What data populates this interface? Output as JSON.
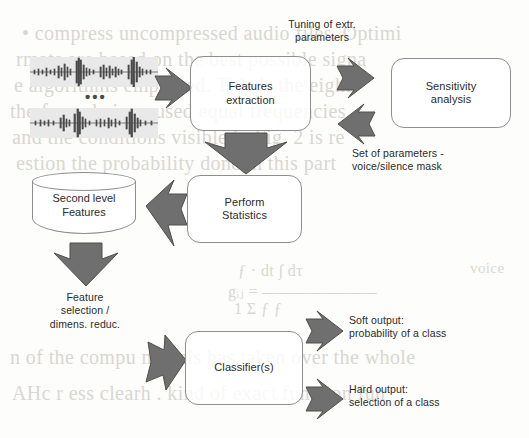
{
  "diagram": {
    "colors": {
      "arrow_fill": "#6f6f6f",
      "arrow_stroke": "#4f4f4f",
      "node_stroke": "#8e8e8e",
      "text": "#2b2b2b",
      "waveform": "#4a4a4a",
      "background": "#fdfdfb",
      "bleed_text": "#d9d7d2"
    },
    "nodes": [
      {
        "id": "features-extraction",
        "label_line1": "Features",
        "label_line2": "extraction"
      },
      {
        "id": "sensitivity-analysis",
        "label_line1": "Sensitivity",
        "label_line2": "analysis"
      },
      {
        "id": "perform-statistics",
        "label_line1": "Perform",
        "label_line2": "Statistics"
      },
      {
        "id": "classifier",
        "label_line1": "Classifier(s)",
        "label_line2": ""
      }
    ],
    "datastore": {
      "id": "second-level-features",
      "label_line1": "Second level",
      "label_line2": "Features"
    },
    "labels": {
      "tuning": "Tuning of extr.\nparameters",
      "set_of_parameters": "Set of parameters -\nvoice/silence mask",
      "feature_selection": "Feature\nselection /\ndimens. reduc.",
      "soft_output": "Soft output:\nprobability of a class",
      "hard_output": "Hard output:\nselection of a class"
    },
    "inputs": {
      "ellipsis": "•••",
      "waveform_count": 2,
      "waveform_name": "audio-waveform"
    },
    "arrows": [
      {
        "id": "waveforms-to-features",
        "direction": "right"
      },
      {
        "id": "features-to-sensitivity",
        "direction": "right"
      },
      {
        "id": "sensitivity-to-features",
        "direction": "left"
      },
      {
        "id": "features-to-statistics",
        "direction": "down"
      },
      {
        "id": "statistics-to-datastore",
        "direction": "left"
      },
      {
        "id": "datastore-to-selection",
        "direction": "down"
      },
      {
        "id": "selection-to-classifier",
        "direction": "right"
      },
      {
        "id": "classifier-to-soft-output",
        "direction": "right"
      },
      {
        "id": "classifier-to-hard-output",
        "direction": "right"
      }
    ]
  },
  "background_bleed": {
    "lines": [
      {
        "text": "• compress uncompressed audio files. Optimi",
        "x": 22,
        "y": 22,
        "size": 20
      },
      {
        "text": "rmats are based on the best possible signa",
        "x": 16,
        "y": 48,
        "size": 20
      },
      {
        "text": "e algorithms employed. This is the eight",
        "x": 14,
        "y": 74,
        "size": 20
      },
      {
        "text": "the formula is as used equal frequencies",
        "x": 10,
        "y": 100,
        "size": 20
      },
      {
        "text": "and the conditions visible in Fig. 2 is re",
        "x": 12,
        "y": 126,
        "size": 20
      },
      {
        "text": "estion the probability done in this part",
        "x": 16,
        "y": 152,
        "size": 20
      },
      {
        "text": "ƒ · dt  ∫  dτ",
        "x": 238,
        "y": 262,
        "size": 16
      },
      {
        "text": "gᵢⱼ =  ———————",
        "x": 228,
        "y": 282,
        "size": 16
      },
      {
        "text": "1     Σ   ƒ   ƒ",
        "x": 234,
        "y": 300,
        "size": 16
      },
      {
        "text": "n of the compu models has taken over the whole",
        "x": 10,
        "y": 346,
        "size": 20
      },
      {
        "text": "AHc  r ess  clearh . kind of exact function fun",
        "x": 12,
        "y": 382,
        "size": 20
      },
      {
        "text": "voice",
        "x": 470,
        "y": 260,
        "size": 15
      }
    ]
  }
}
